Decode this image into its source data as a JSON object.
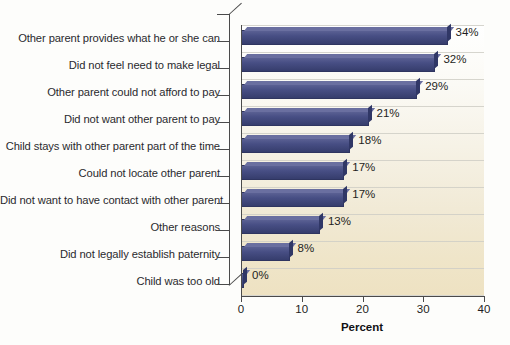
{
  "chart_data": {
    "type": "bar",
    "orientation": "horizontal",
    "title": "",
    "subtitle": "",
    "xlabel": "Percent",
    "ylabel": "",
    "xlim": [
      0,
      40
    ],
    "xticks": [
      0,
      10,
      20,
      30,
      40
    ],
    "grid": true,
    "legend": false,
    "categories": [
      "Other parent provides what he or she can",
      "Did not feel need to make legal",
      "Other parent could not afford to pay",
      "Did not want other parent to pay",
      "Child stays with other parent part of the time",
      "Could not locate other parent",
      "Did not want to have contact with other parent",
      "Other reasons",
      "Did not legally establish paternity",
      "Child was too old"
    ],
    "values": [
      34,
      32,
      29,
      21,
      18,
      17,
      17,
      13,
      8,
      0
    ],
    "value_labels": [
      "34%",
      "32%",
      "29%",
      "21%",
      "18%",
      "17%",
      "17%",
      "13%",
      "8%",
      "0%"
    ],
    "bar_color": "#474e84",
    "bar_color_top": "#6a6fa0",
    "bar_color_side": "#303766",
    "plot_background_top": "#ffffff",
    "plot_background_bottom": "#eee2c2",
    "gridline_color": "#cfcec6",
    "axis_color": "#4a4a4a",
    "text_color": "#2a2a2e"
  }
}
